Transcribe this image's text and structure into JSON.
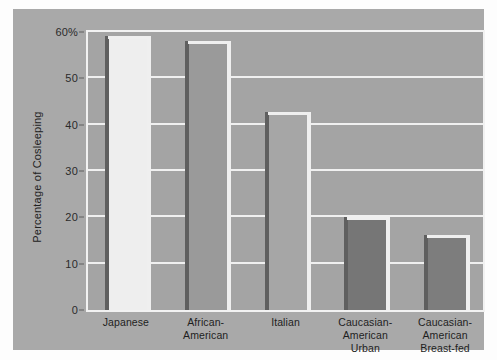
{
  "chart_data": {
    "type": "bar",
    "title": "",
    "xlabel": "",
    "ylabel": "Percentage of Cosleeping",
    "ylim": [
      0,
      60
    ],
    "yticks": [
      0,
      10,
      20,
      30,
      40,
      50,
      60
    ],
    "ytick_labels": [
      "0",
      "10",
      "20",
      "30",
      "40",
      "50",
      "60%"
    ],
    "grid": true,
    "legend": "none",
    "categories": [
      "Japanese",
      "African-American",
      "Italian",
      "Caucasian-American Urban",
      "Caucasian-American Breast-fed"
    ],
    "category_lines": [
      [
        "Japanese"
      ],
      [
        "African-American"
      ],
      [
        "Italian"
      ],
      [
        "Caucasian-",
        "American",
        "Urban"
      ],
      [
        "Caucasian-",
        "American",
        "Breast-fed"
      ]
    ],
    "values": [
      58.5,
      57.5,
      42,
      19.5,
      15.5
    ],
    "bar_colors": [
      "#eeeeee",
      "#9a9a9a",
      "#a6a6a6",
      "#767676",
      "#7d7d7d"
    ]
  },
  "colors": {
    "page_background": "#fdfdfd",
    "panel_background": "#a9a9a9",
    "plot_background": "#a4a4a4",
    "gridline": "#f0f0f0",
    "frame": "#f2f2f2",
    "text": "#222222",
    "bar_highlight": "#efefef",
    "bar_shadow": "#5f5f5f"
  }
}
